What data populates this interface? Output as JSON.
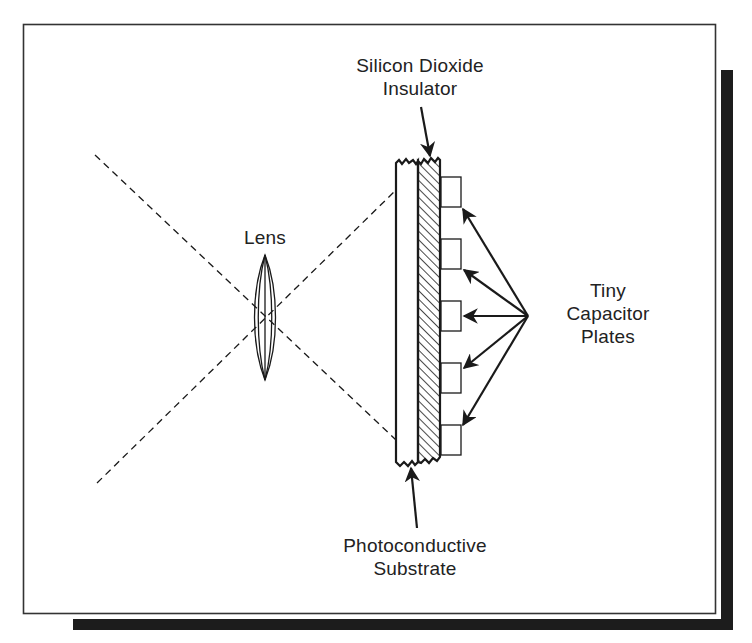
{
  "diagram": {
    "labels": {
      "insulator": {
        "line1": "Silicon Dioxide",
        "line2": "Insulator"
      },
      "lens": "Lens",
      "capacitors": {
        "line1": "Tiny",
        "line2": "Capacitor",
        "line3": "Plates"
      },
      "substrate": {
        "line1": "Photoconductive",
        "line2": "Substrate"
      }
    },
    "components": [
      {
        "name": "lens",
        "type": "convex-lens"
      },
      {
        "name": "light-rays",
        "type": "dashed-lines",
        "count": 2
      },
      {
        "name": "photoconductive-substrate",
        "type": "layer"
      },
      {
        "name": "silicon-dioxide-insulator",
        "type": "hatched-layer"
      },
      {
        "name": "capacitor-plates",
        "type": "plate-array",
        "count": 5
      }
    ],
    "colors": {
      "ink": "#1a1a1a",
      "frame": "#333333",
      "shadow": "#1c1c1c",
      "background": "#ffffff"
    }
  }
}
